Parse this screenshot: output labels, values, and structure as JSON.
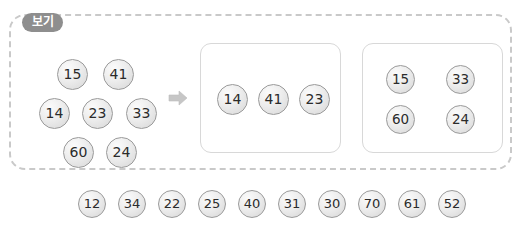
{
  "top_artifact": {
    "text": ""
  },
  "example_panel": {
    "tag_label": "보기",
    "source_cluster": {
      "name": "source-number-cluster",
      "rows": [
        {
          "tokens": [
            {
              "value": "15",
              "x": 48,
              "y": 45
            },
            {
              "value": "41",
              "x": 94,
              "y": 45
            }
          ]
        },
        {
          "tokens": [
            {
              "value": "14",
              "x": 30,
              "y": 84
            },
            {
              "value": "23",
              "x": 73,
              "y": 84
            },
            {
              "value": "33",
              "x": 117,
              "y": 84
            }
          ]
        },
        {
          "tokens": [
            {
              "value": "60",
              "x": 54,
              "y": 123
            },
            {
              "value": "24",
              "x": 97,
              "y": 123
            }
          ]
        }
      ],
      "all_values": [
        "15",
        "41",
        "14",
        "23",
        "33",
        "60",
        "24"
      ]
    },
    "arrow": {
      "icon": "arrow-right-icon",
      "color": "#c0c0c0"
    },
    "result_boxes": [
      {
        "name": "result-box-odd",
        "tokens": [
          {
            "value": "14",
            "x": 16,
            "y": 40
          },
          {
            "value": "41",
            "x": 57,
            "y": 40
          },
          {
            "value": "23",
            "x": 98,
            "y": 40
          }
        ]
      },
      {
        "name": "result-box-even",
        "tokens": [
          {
            "value": "15",
            "x": 23,
            "y": 21
          },
          {
            "value": "33",
            "x": 83,
            "y": 21
          },
          {
            "value": "60",
            "x": 23,
            "y": 61
          },
          {
            "value": "24",
            "x": 83,
            "y": 61
          }
        ]
      }
    ]
  },
  "number_pool": {
    "name": "number-pool",
    "tokens": [
      {
        "value": "12",
        "x": 78
      },
      {
        "value": "34",
        "x": 118
      },
      {
        "value": "22",
        "x": 158
      },
      {
        "value": "25",
        "x": 198
      },
      {
        "value": "40",
        "x": 238
      },
      {
        "value": "31",
        "x": 278
      },
      {
        "value": "30",
        "x": 318
      },
      {
        "value": "70",
        "x": 358
      },
      {
        "value": "61",
        "x": 398
      },
      {
        "value": "52",
        "x": 438
      }
    ]
  },
  "colors": {
    "dashed_border": "#c9c9c9",
    "tag_background": "#8e8e8e",
    "tag_text": "#ffffff",
    "token_border": "#9a9a9a",
    "token_text": "#2b2b2b",
    "result_box_border": "#d8d8d8",
    "page_background": "#ffffff"
  }
}
